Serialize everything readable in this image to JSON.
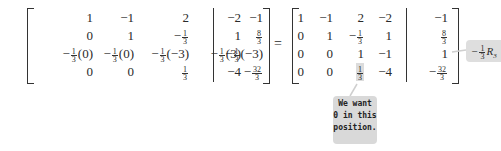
{
  "left_matrix": {
    "rows": [
      [
        "1",
        "−1",
        "2",
        "−2",
        "−1"
      ],
      [
        "0",
        "1",
        "−1/3",
        "1",
        "8/3"
      ],
      [
        "−1/3(0)",
        "−1/3(0)",
        "−1/3(−3)",
        "−1/3(3)",
        "−1/3(−3)"
      ],
      [
        "0",
        "0",
        "1/3",
        "−4",
        "−32/3"
      ]
    ]
  },
  "equals": "=",
  "right_matrix": {
    "rows": [
      [
        "1",
        "−1",
        "2",
        "−2",
        "−1"
      ],
      [
        "0",
        "1",
        "−1/3",
        "1",
        "8/3"
      ],
      [
        "0",
        "0",
        "1",
        "−1",
        "1"
      ],
      [
        "0",
        "0",
        "1/3",
        "−4",
        "−32/3"
      ]
    ],
    "highlighted_cell": {
      "row": 3,
      "col": 2
    }
  },
  "row_operation": {
    "coef_num": "1",
    "coef_den": "3",
    "sign": "−",
    "label": "R",
    "sub": "3"
  },
  "callout": {
    "lines": [
      "We want",
      "0 in this",
      "position."
    ]
  }
}
